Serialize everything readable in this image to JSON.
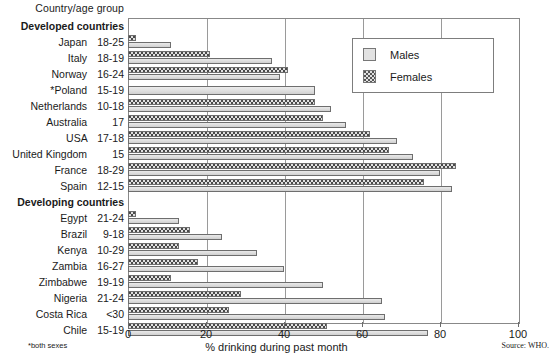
{
  "header": {
    "axis_title": "Country/age group"
  },
  "legend": {
    "position": "top-right",
    "items": [
      {
        "label": "Males",
        "icon": "solid-swatch"
      },
      {
        "label": "Females",
        "icon": "dotted-swatch"
      }
    ]
  },
  "axis": {
    "x_label": "% drinking during past month",
    "ticks": [
      "0",
      "20",
      "40",
      "60",
      "80",
      "100"
    ],
    "min": 0,
    "max": 100
  },
  "footnote": "*both sexes",
  "source": "Source: WHO.",
  "chart_data": {
    "type": "bar",
    "orientation": "horizontal",
    "title": "",
    "subtitle": "",
    "xlabel": "% drinking during past month",
    "ylabel": "Country/age group",
    "xlim": [
      0,
      100
    ],
    "grid": true,
    "legend_position": "top-right",
    "series": [
      {
        "name": "Males",
        "values": [
          11,
          37,
          39,
          48,
          52,
          56,
          69,
          73,
          80,
          83,
          13,
          24,
          33,
          40,
          50,
          65,
          66,
          77
        ]
      },
      {
        "name": "Females",
        "values": [
          2,
          21,
          41,
          48,
          48,
          50,
          62,
          67,
          84,
          76,
          2,
          16,
          13,
          18,
          11,
          29,
          26,
          51
        ]
      }
    ],
    "rows": [
      {
        "type": "group",
        "label": "Developed countries"
      },
      {
        "type": "data",
        "country": "Japan",
        "age": "18-25",
        "males": 11,
        "females": 2
      },
      {
        "type": "data",
        "country": "Italy",
        "age": "18-19",
        "males": 37,
        "females": 21
      },
      {
        "type": "data",
        "country": "Norway",
        "age": "16-24",
        "males": 39,
        "females": 41
      },
      {
        "type": "data",
        "country": "*Poland",
        "age": "15-19",
        "both": 48
      },
      {
        "type": "data",
        "country": "Netherlands",
        "age": "10-18",
        "males": 52,
        "females": 48
      },
      {
        "type": "data",
        "country": "Australia",
        "age": "17",
        "males": 56,
        "females": 50
      },
      {
        "type": "data",
        "country": "USA",
        "age": "17-18",
        "males": 69,
        "females": 62
      },
      {
        "type": "data",
        "country": "United Kingdom",
        "age": "15",
        "males": 73,
        "females": 67
      },
      {
        "type": "data",
        "country": "France",
        "age": "18-29",
        "males": 80,
        "females": 84
      },
      {
        "type": "data",
        "country": "Spain",
        "age": "12-15",
        "males": 83,
        "females": 76
      },
      {
        "type": "group",
        "label": "Developing countries"
      },
      {
        "type": "data",
        "country": "Egypt",
        "age": "21-24",
        "males": 13,
        "females": 2
      },
      {
        "type": "data",
        "country": "Brazil",
        "age": "9-18",
        "males": 24,
        "females": 16
      },
      {
        "type": "data",
        "country": "Kenya",
        "age": "10-29",
        "males": 33,
        "females": 13
      },
      {
        "type": "data",
        "country": "Zambia",
        "age": "16-27",
        "males": 40,
        "females": 18
      },
      {
        "type": "data",
        "country": "Zimbabwe",
        "age": "19-19",
        "males": 50,
        "females": 11
      },
      {
        "type": "data",
        "country": "Nigeria",
        "age": "21-24",
        "males": 65,
        "females": 29
      },
      {
        "type": "data",
        "country": "Costa Rica",
        "age": "<30",
        "males": 66,
        "females": 26
      },
      {
        "type": "data",
        "country": "Chile",
        "age": "15-19",
        "males": 77,
        "females": 51
      }
    ]
  }
}
